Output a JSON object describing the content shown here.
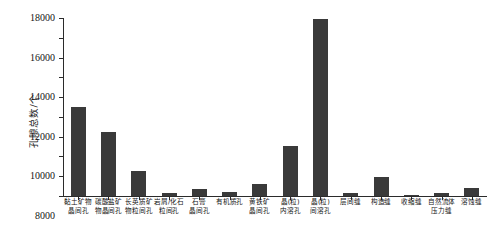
{
  "chart_data": {
    "type": "bar",
    "title": "",
    "xlabel": "",
    "ylabel": "孔隙总数/个",
    "ylim": [
      0,
      18000
    ],
    "ytick_step": 2000,
    "grid": false,
    "legend": false,
    "bar_color": "#3a3a3a",
    "axis_color": "#2b2b2b",
    "yticks": [
      "0",
      "2000",
      "4000",
      "6000",
      "8000",
      "10000",
      "12000",
      "14000",
      "16000",
      "18000"
    ],
    "categories": [
      "黏土矿物晶间孔",
      "碳酸盐矿物晶间孔",
      "长英质矿物粒间孔",
      "岩屑/化石粒间孔",
      "石膏晶间孔",
      "有机质孔",
      "黄铁矿晶间孔",
      "晶(粒)内溶孔",
      "晶(粒)间溶孔",
      "层间缝",
      "构造缝",
      "收缩缝",
      "自然流体压力缝",
      "溶蚀缝"
    ],
    "category_lines": [
      [
        "黏土矿物",
        "晶间孔"
      ],
      [
        "碳酸盐矿",
        "物晶间孔"
      ],
      [
        "长英质矿",
        "物粒间孔"
      ],
      [
        "岩屑/化石",
        "粒间孔"
      ],
      [
        "石膏",
        "晶间孔"
      ],
      [
        "有机质孔"
      ],
      [
        "黄铁矿",
        "晶间孔"
      ],
      [
        "晶(粒)",
        "内溶孔"
      ],
      [
        "晶(粒)",
        "间溶孔"
      ],
      [
        "层间缝"
      ],
      [
        "构造缝"
      ],
      [
        "收缩缝"
      ],
      [
        "自然流体",
        "压力缝"
      ],
      [
        "溶蚀缝"
      ]
    ],
    "values": [
      9020,
      6500,
      2550,
      330,
      750,
      400,
      1180,
      5050,
      17900,
      350,
      1900,
      120,
      300,
      780
    ]
  }
}
